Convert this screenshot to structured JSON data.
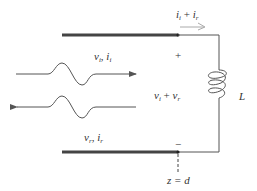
{
  "diagram": {
    "type": "transmission-line-inductive-termination",
    "colors": {
      "conductor": "#444444",
      "wire": "#555555",
      "current_arrow": "#aaaaaa",
      "text": "#333333"
    },
    "labels": {
      "total_current": {
        "base1": "i",
        "sub1": "i",
        "op": " + ",
        "base2": "i",
        "sub2": "r"
      },
      "incident_wave": {
        "base1": "v",
        "sub1": "i",
        "sep": ", ",
        "base2": "i",
        "sub2": "i"
      },
      "reflected_wave": {
        "base1": "v",
        "sub1": "r",
        "sep": ", ",
        "base2": "i",
        "sub2": "r"
      },
      "load_voltage": {
        "base1": "v",
        "sub1": "i",
        "op": " + ",
        "base2": "v",
        "sub2": "r"
      },
      "plus_sign": "+",
      "minus_sign": "−",
      "inductor": "L",
      "position": "z = d"
    }
  }
}
